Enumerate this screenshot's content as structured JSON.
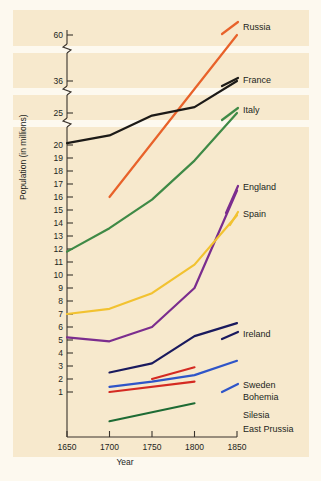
{
  "chart_data": {
    "type": "line",
    "title": "",
    "xlabel": "Year",
    "ylabel": "Population (in millions)",
    "grid": false,
    "legend_position": "right-inline-labels",
    "xlim": [
      1650,
      1850
    ],
    "x_ticks": [
      "1650",
      "1700",
      "1750",
      "1800",
      "1850"
    ],
    "y_ticks": [
      "1",
      "2",
      "3",
      "4",
      "5",
      "6",
      "7",
      "8",
      "9",
      "10",
      "11",
      "12",
      "13",
      "14",
      "15",
      "16",
      "17",
      "18",
      "19",
      "20",
      "25",
      "36",
      "60"
    ],
    "y_axis_breaks": [
      {
        "between": "20-25"
      },
      {
        "between": "25-36"
      },
      {
        "between": "36-60"
      }
    ],
    "ylabel_note": "Axis is broken above 20; values 25, 36 and 60 are compressed",
    "series": [
      {
        "name": "Russia",
        "color": "#E8622A",
        "x": [
          1700,
          1850
        ],
        "values": [
          16.0,
          60.0
        ]
      },
      {
        "name": "France",
        "color": "#1C1A17",
        "x": [
          1650,
          1700,
          1750,
          1800,
          1850
        ],
        "values": [
          20.3,
          21.5,
          24.6,
          27.0,
          36.0
        ]
      },
      {
        "name": "Italy",
        "color": "#3F8A46",
        "x": [
          1650,
          1700,
          1750,
          1800,
          1850
        ],
        "values": [
          11.8,
          13.6,
          15.8,
          18.8,
          25.0
        ]
      },
      {
        "name": "England",
        "color": "#7B2D8E",
        "x": [
          1650,
          1700,
          1750,
          1800,
          1850
        ],
        "values": [
          5.2,
          4.9,
          6.0,
          9.0,
          16.5
        ]
      },
      {
        "name": "Spain",
        "color": "#F2C230",
        "x": [
          1650,
          1700,
          1750,
          1800,
          1850
        ],
        "values": [
          7.0,
          7.4,
          8.6,
          10.8,
          14.6
        ]
      },
      {
        "name": "Ireland",
        "color": "#1A1A5E",
        "x": [
          1700,
          1750,
          1800,
          1850
        ],
        "values": [
          2.5,
          3.2,
          5.3,
          6.3
        ]
      },
      {
        "name": "Sweden",
        "color": "#2F55C8",
        "x": [
          1700,
          1750,
          1800,
          1850
        ],
        "values": [
          1.4,
          1.8,
          2.3,
          3.4
        ]
      },
      {
        "name": "Bohemia",
        "color": "#D42A22",
        "x": [
          1750,
          1800
        ],
        "values": [
          2.0,
          2.9
        ]
      },
      {
        "name": "Silesia",
        "color": "#D42A22",
        "x": [
          1700,
          1800
        ],
        "values": [
          1.0,
          1.8
        ]
      },
      {
        "name": "East Prussia",
        "color": "#1E6B34",
        "x": [
          1700,
          1800
        ],
        "values": [
          0.35,
          0.75
        ]
      }
    ],
    "legend": [
      {
        "label": "Russia"
      },
      {
        "label": "France"
      },
      {
        "label": "Italy"
      },
      {
        "label": "England"
      },
      {
        "label": "Spain"
      },
      {
        "label": "Ireland"
      },
      {
        "label": "Sweden"
      },
      {
        "label": "Bohemia"
      },
      {
        "label": "Silesia"
      },
      {
        "label": "East Prussia"
      }
    ]
  }
}
